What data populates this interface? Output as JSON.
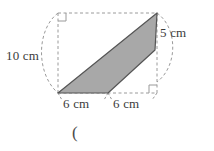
{
  "figure": {
    "kind": "geometry-diagram",
    "colors": {
      "shape_fill": "#a8a8a8",
      "shape_stroke": "#555555",
      "dashed_guide": "#9a9a9a",
      "text": "#3b3b3b",
      "background": "#ffffff"
    },
    "labels": {
      "left_height": "10 cm",
      "right_height": "5 cm",
      "bottom_left_base": "6 cm",
      "bottom_right_base": "6 cm"
    },
    "right_angle_markers": [
      {
        "name": "top-left-right-angle",
        "x": 58,
        "y": 13
      },
      {
        "name": "bottom-right-right-angle",
        "x": 157,
        "y": 93
      }
    ],
    "shape_vertices": [
      {
        "x": 58,
        "y": 93
      },
      {
        "x": 157,
        "y": 13
      },
      {
        "x": 155,
        "y": 50
      },
      {
        "x": 108,
        "y": 93
      }
    ],
    "dashed_rect": {
      "x": 58,
      "y": 13,
      "width": 99,
      "height": 80
    },
    "stray_text": "("
  }
}
